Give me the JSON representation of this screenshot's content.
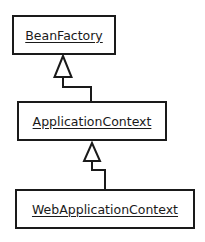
{
  "diagram": {
    "type": "uml-class-inheritance",
    "classes": [
      {
        "id": "beanfactory",
        "name": "BeanFactory"
      },
      {
        "id": "applicationcontext",
        "name": "ApplicationContext"
      },
      {
        "id": "webapplicationcontext",
        "name": "WebApplicationContext"
      }
    ],
    "relations": [
      {
        "from": "ApplicationContext",
        "to": "BeanFactory",
        "kind": "generalization"
      },
      {
        "from": "WebApplicationContext",
        "to": "ApplicationContext",
        "kind": "generalization"
      }
    ],
    "colors": {
      "stroke": "#1a1a1a",
      "background": "#ffffff"
    }
  }
}
